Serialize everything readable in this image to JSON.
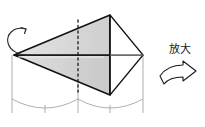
{
  "figure": {
    "canvas": {
      "width": 205,
      "height": 127,
      "background": "#ffffff"
    },
    "annotations": {
      "magnify_label": "放大",
      "magnify_arrow_name": "block-arrow-right",
      "rotation_arrow_name": "rotation-arrow-ccw"
    },
    "colors": {
      "face_fill_upper": "#d6d6d6",
      "face_fill_lower": "#cfcfcf",
      "face_fill_light": "#e8e8e8",
      "outline_heavy": "#111111",
      "outline_light": "#8c8c8c",
      "cylinder_line": "#9a9a9a",
      "dashed_axis": "#1a1a1a",
      "text": "#1a1a1a"
    },
    "geometry": {
      "apex_left": [
        14,
        55
      ],
      "apex_right": [
        143,
        55
      ],
      "top_vertex": [
        110,
        15
      ],
      "bottom_vertex": [
        110,
        95
      ],
      "spine_y": 55,
      "dashed_axis_x": 78,
      "dashed_axis_top": 20,
      "dashed_axis_bottom": 92,
      "cylinder_left_x": [
        12,
        78
      ],
      "cylinder_right_x": [
        78,
        143
      ],
      "cylinder_top_y": 55,
      "cylinder_bottom_y": 113,
      "arc_sag": 14,
      "tick_marks_x": [
        45,
        110
      ]
    },
    "parts": [
      {
        "name": "upper-wedge-face",
        "shaded": true
      },
      {
        "name": "lower-wedge-face",
        "shaded": true
      },
      {
        "name": "upper-right-triangle",
        "shaded": false
      },
      {
        "name": "lower-right-triangle",
        "shaded": false
      },
      {
        "name": "vertical-back-edge",
        "shaded": false
      },
      {
        "name": "cylinder-left",
        "shaded": false
      },
      {
        "name": "cylinder-right",
        "shaded": false
      }
    ]
  }
}
